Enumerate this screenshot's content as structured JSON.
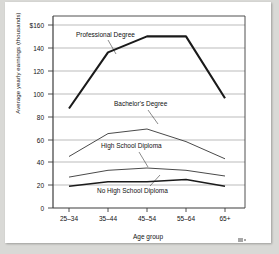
{
  "chart_data": {
    "type": "line",
    "title": "",
    "xlabel": "Age group",
    "ylabel": "Average yearly earnings (thousands)",
    "categories": [
      "25–34",
      "35–44",
      "45–54",
      "55–64",
      "65+"
    ],
    "ytick_labels": [
      "$160",
      "140",
      "120",
      "100",
      "80",
      "60",
      "40",
      "20",
      "0"
    ],
    "ytick_values": [
      160,
      140,
      120,
      100,
      80,
      60,
      40,
      20,
      0
    ],
    "ylim": [
      0,
      160
    ],
    "grid": "horizontal",
    "legend_position": "inline-annotations",
    "series": [
      {
        "name": "Professional Degree",
        "values": [
          87,
          136,
          150,
          150,
          96
        ],
        "color": "#1a1a1a",
        "width": 2.1
      },
      {
        "name": "Bachelor's Degree",
        "values": [
          45,
          65,
          69,
          58,
          43
        ],
        "color": "#4a4a4a",
        "width": 1.0
      },
      {
        "name": "High School Diploma",
        "values": [
          27,
          33,
          35,
          33,
          28
        ],
        "color": "#4a4a4a",
        "width": 1.0
      },
      {
        "name": "No High School Diploma",
        "values": [
          19,
          23,
          23,
          25,
          19
        ],
        "color": "#1a1a1a",
        "width": 1.5
      }
    ],
    "annotations": [
      {
        "text": "Professional Degree",
        "x": 76,
        "y": 35
      },
      {
        "text": "Bachelor's Degree",
        "x": 116,
        "y": 104
      },
      {
        "text": "High School Diploma",
        "x": 104,
        "y": 146
      },
      {
        "text": "No High School Diploma",
        "x": 100,
        "y": 191
      }
    ]
  }
}
